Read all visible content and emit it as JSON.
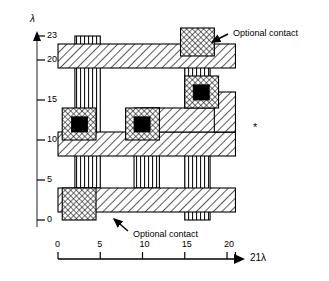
{
  "figure": {
    "type": "vlsi-layout-diagram",
    "title": "",
    "axes": {
      "y": {
        "symbol": "λ",
        "ticks": [
          0,
          5,
          10,
          15,
          20,
          23
        ],
        "tick_labels": [
          "0",
          "5",
          "10",
          "15",
          "20",
          "23"
        ],
        "range": [
          0,
          23
        ],
        "arrow": "up"
      },
      "x": {
        "label": "21λ",
        "ticks": [
          0,
          5,
          10,
          15,
          20,
          21
        ],
        "tick_labels": [
          "0",
          "5",
          "10",
          "15",
          "20",
          ""
        ],
        "range": [
          0,
          21
        ],
        "arrow": "right"
      }
    },
    "annotations": [
      {
        "id": "opt-contact-top",
        "text": "Optional contact"
      },
      {
        "id": "opt-contact-bottom",
        "text": "Optional contact"
      }
    ],
    "marker": {
      "id": "asterisk-marker",
      "text": "*"
    }
  },
  "chart_data": {
    "type": "table",
    "title": "",
    "xlabel": "21λ",
    "ylabel": "λ",
    "xlim": [
      0,
      21
    ],
    "ylim": [
      0,
      23
    ],
    "grid": false,
    "legend": "none",
    "layers": [
      {
        "name": "metal",
        "pattern": "diagonal-hatch",
        "color": "#000000"
      },
      {
        "name": "poly",
        "pattern": "vertical-lines",
        "color": "#000000"
      },
      {
        "name": "diffusion",
        "pattern": "cross-hatch",
        "color": "#000000"
      },
      {
        "name": "contact",
        "pattern": "solid-black",
        "color": "#000000"
      }
    ],
    "shapes": [
      {
        "layer": "poly",
        "x": 2,
        "y": 4,
        "w": 3,
        "h": 19
      },
      {
        "layer": "poly",
        "x": 9,
        "y": 4,
        "w": 3,
        "h": 10
      },
      {
        "layer": "poly",
        "x": 15,
        "y": 0,
        "w": 3,
        "h": 23
      },
      {
        "layer": "metal",
        "x": 0,
        "y": 19,
        "w": 21,
        "h": 3
      },
      {
        "layer": "metal",
        "x": 0,
        "y": 8,
        "w": 21,
        "h": 3
      },
      {
        "layer": "metal",
        "x": 0,
        "y": 1,
        "w": 21,
        "h": 3
      },
      {
        "layer": "metal",
        "x": 10,
        "y": 11,
        "w": 11,
        "h": 3
      },
      {
        "layer": "metal",
        "x": 18.5,
        "y": 11,
        "w": 2.5,
        "h": 5
      },
      {
        "layer": "diffusion",
        "x": 0.5,
        "y": 10,
        "w": 4,
        "h": 4
      },
      {
        "layer": "diffusion",
        "x": 8,
        "y": 10,
        "w": 4,
        "h": 4
      },
      {
        "layer": "diffusion",
        "x": 15,
        "y": 14,
        "w": 4,
        "h": 4
      },
      {
        "layer": "diffusion",
        "x": 14.5,
        "y": 20.5,
        "w": 4,
        "h": 3.5
      },
      {
        "layer": "diffusion",
        "x": 0.5,
        "y": 0,
        "w": 4,
        "h": 4
      },
      {
        "layer": "contact",
        "x": 1.6,
        "y": 11,
        "w": 1.9,
        "h": 1.9
      },
      {
        "layer": "contact",
        "x": 9,
        "y": 11,
        "w": 1.9,
        "h": 1.9
      },
      {
        "layer": "contact",
        "x": 16,
        "y": 15,
        "w": 1.9,
        "h": 1.9
      }
    ]
  }
}
